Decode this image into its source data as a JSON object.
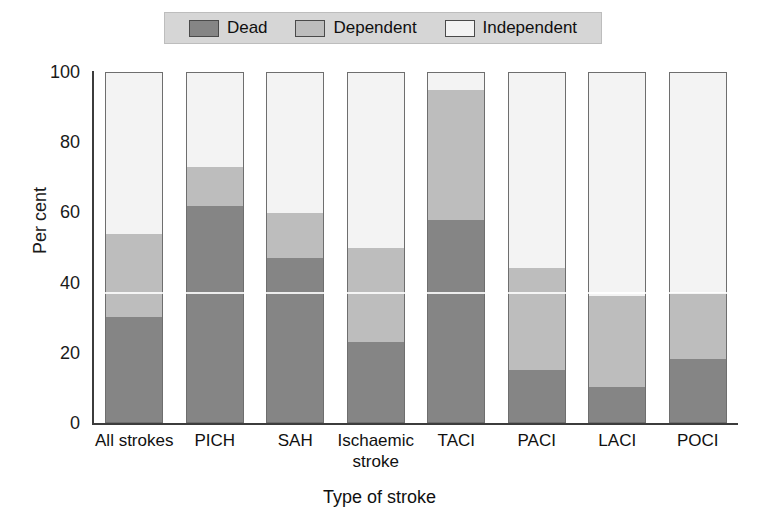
{
  "legend": {
    "entries": [
      {
        "label": "Dead",
        "color": "#858585"
      },
      {
        "label": "Dependent",
        "color": "#bdbdbd"
      },
      {
        "label": "Independent",
        "color": "#f3f3f3"
      }
    ]
  },
  "axes": {
    "ylabel": "Per cent",
    "xlabel": "Type of stroke",
    "yticks": [
      "0",
      "20",
      "40",
      "60",
      "80",
      "100"
    ]
  },
  "chart_data": {
    "type": "bar",
    "title": "",
    "xlabel": "Type of stroke",
    "ylabel": "Per cent",
    "ylim": [
      0,
      100
    ],
    "yticks": [
      0,
      20,
      40,
      60,
      80,
      100
    ],
    "grid": false,
    "stacked": true,
    "legend_position": "top",
    "categories": [
      "All strokes",
      "PICH",
      "SAH",
      "Ischaemic stroke",
      "TACI",
      "PACI",
      "LACI",
      "POCI"
    ],
    "series": [
      {
        "name": "Dead",
        "color": "#858585",
        "values": [
          30,
          62,
          47,
          23,
          58,
          15,
          10,
          18
        ]
      },
      {
        "name": "Dependent",
        "color": "#bdbdbd",
        "values": [
          24,
          11,
          13,
          27,
          37,
          29,
          26,
          19
        ]
      },
      {
        "name": "Independent",
        "color": "#f3f3f3",
        "values": [
          46,
          27,
          40,
          50,
          5,
          56,
          64,
          63
        ]
      }
    ]
  }
}
